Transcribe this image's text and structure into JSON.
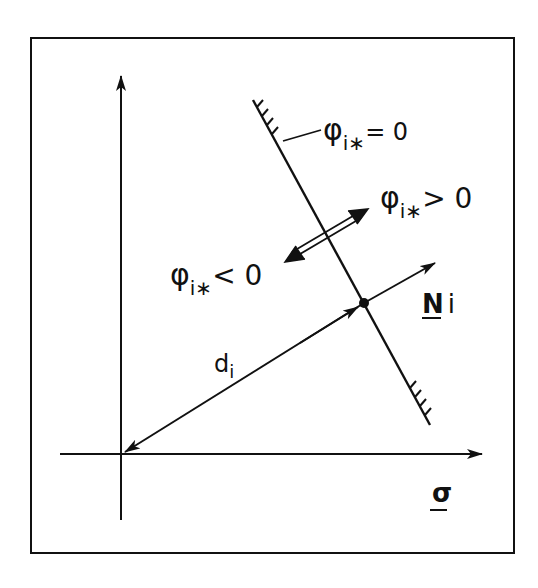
{
  "diagram": {
    "type": "yield-surface-normal-diagram",
    "colors": {
      "ink": "#111111",
      "background": "#ffffff"
    },
    "labels": {
      "surface": {
        "symbol": "φ",
        "sub": "i∗",
        "relation": "= 0"
      },
      "outside": {
        "symbol": "φ",
        "sub": "i∗",
        "relation": "> 0"
      },
      "inside": {
        "symbol": "φ",
        "sub": "i∗",
        "relation": "< 0"
      },
      "normal": {
        "symbol": "N",
        "sub": "i"
      },
      "distance": {
        "symbol": "d",
        "sub": "i"
      },
      "axis": {
        "symbol": "σ"
      }
    },
    "elements": [
      "frame-border",
      "vertical-axis-arrow",
      "horizontal-axis-arrow-sigma",
      "hatched-yield-line",
      "double-arrow-inside-outside",
      "distance-vector-d-i",
      "normal-vector-N-i",
      "intersection-point"
    ]
  }
}
